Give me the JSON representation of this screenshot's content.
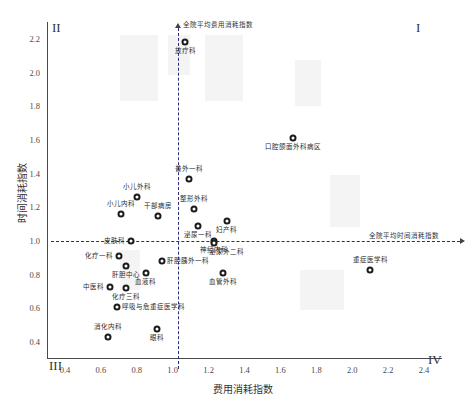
{
  "chart_data": {
    "type": "scatter",
    "title": "",
    "xlabel": "费用消耗指数",
    "ylabel": "时间消耗指数",
    "xlim": [
      0.3,
      2.5
    ],
    "ylim": [
      0.3,
      2.3
    ],
    "xticks": [
      "0.4",
      "0.6",
      "0.8",
      "1.0",
      "1.2",
      "1.4",
      "1.6",
      "1.8",
      "2.0",
      "2.2",
      "2.4"
    ],
    "xtick_values": [
      0.4,
      0.6,
      0.8,
      1.0,
      1.2,
      1.4,
      1.6,
      1.8,
      2.0,
      2.2,
      2.4
    ],
    "yticks": [
      "0.4",
      "0.6",
      "0.8",
      "1.0",
      "1.2",
      "1.4",
      "1.6",
      "1.8",
      "2.0",
      "2.2"
    ],
    "ytick_values": [
      0.4,
      0.6,
      0.8,
      1.0,
      1.2,
      1.4,
      1.6,
      1.8,
      2.0,
      2.2
    ],
    "grid": false,
    "legend": "none",
    "reference_lines": {
      "vertical": {
        "value": 1.03,
        "label": "全院平均费用消耗指数"
      },
      "horizontal": {
        "value": 1.0,
        "label": "全院平均时间消耗指数"
      }
    },
    "quadrant_labels": {
      "q1": "I",
      "q2": "II",
      "q3": "III",
      "q4": "IV"
    },
    "points": [
      {
        "label": "放疗科",
        "x": 1.07,
        "y": 2.18,
        "label_pos": "below"
      },
      {
        "label": "口腔颌面外科病区",
        "x": 1.67,
        "y": 1.61,
        "label_pos": "below"
      },
      {
        "label": "普外一科",
        "x": 1.09,
        "y": 1.37,
        "label_pos": "above"
      },
      {
        "label": "小儿外科",
        "x": 0.8,
        "y": 1.26,
        "label_pos": "above"
      },
      {
        "label": "整形外科",
        "x": 1.12,
        "y": 1.19,
        "label_pos": "above"
      },
      {
        "label": "小儿内科",
        "x": 0.71,
        "y": 1.16,
        "label_pos": "above"
      },
      {
        "label": "干部病房",
        "x": 0.92,
        "y": 1.15,
        "label_pos": "above"
      },
      {
        "label": "妇产科",
        "x": 1.3,
        "y": 1.12,
        "label_pos": "below"
      },
      {
        "label": "泌尿一科",
        "x": 1.14,
        "y": 1.09,
        "label_pos": "below"
      },
      {
        "label": "皮肤科",
        "x": 0.77,
        "y": 1.0,
        "label_pos": "left"
      },
      {
        "label": "神经内科",
        "x": 1.23,
        "y": 1.0,
        "label_pos": "below"
      },
      {
        "label": "泌尿外二科",
        "x": 1.23,
        "y": 0.99,
        "label_pos": "belowright"
      },
      {
        "label": "化疗一科",
        "x": 0.7,
        "y": 0.91,
        "label_pos": "left"
      },
      {
        "label": "肝胆胰外一科",
        "x": 0.94,
        "y": 0.88,
        "label_pos": "right"
      },
      {
        "label": "肝胆中心",
        "x": 0.74,
        "y": 0.85,
        "label_pos": "below"
      },
      {
        "label": "血液科",
        "x": 0.85,
        "y": 0.81,
        "label_pos": "below"
      },
      {
        "label": "血管外科",
        "x": 1.28,
        "y": 0.81,
        "label_pos": "below"
      },
      {
        "label": "重症医学科",
        "x": 2.1,
        "y": 0.83,
        "label_pos": "above"
      },
      {
        "label": "中医科",
        "x": 0.65,
        "y": 0.73,
        "label_pos": "left"
      },
      {
        "label": "化疗三科",
        "x": 0.74,
        "y": 0.72,
        "label_pos": "below"
      },
      {
        "label": "呼吸与危重症医学科",
        "x": 0.69,
        "y": 0.61,
        "label_pos": "right"
      },
      {
        "label": "眼科",
        "x": 0.91,
        "y": 0.48,
        "label_pos": "below"
      },
      {
        "label": "消化内科",
        "x": 0.64,
        "y": 0.43,
        "label_pos": "above"
      }
    ]
  }
}
